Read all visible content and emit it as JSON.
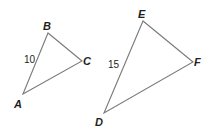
{
  "diagram": {
    "triangles": [
      {
        "name": "ABC",
        "vertices": {
          "A": {
            "label": "A",
            "x": 23,
            "y": 94,
            "lx": 14,
            "ly": 108
          },
          "B": {
            "label": "B",
            "x": 48,
            "y": 33,
            "lx": 43,
            "ly": 30
          },
          "C": {
            "label": "C",
            "x": 82,
            "y": 61,
            "lx": 83,
            "ly": 65
          }
        },
        "side_labels": [
          {
            "side": "AB",
            "text": "10",
            "x": 24,
            "y": 63
          }
        ]
      },
      {
        "name": "DEF",
        "vertices": {
          "D": {
            "label": "D",
            "x": 104,
            "y": 113,
            "lx": 95,
            "ly": 126
          },
          "E": {
            "label": "E",
            "x": 143,
            "y": 21,
            "lx": 138,
            "ly": 18
          },
          "F": {
            "label": "F",
            "x": 193,
            "y": 62,
            "lx": 194,
            "ly": 66
          }
        },
        "side_labels": [
          {
            "side": "DE",
            "text": "15",
            "x": 108,
            "y": 68
          }
        ]
      }
    ],
    "colors": {
      "stroke": "#7a7a7a",
      "text": "#231f20"
    }
  }
}
